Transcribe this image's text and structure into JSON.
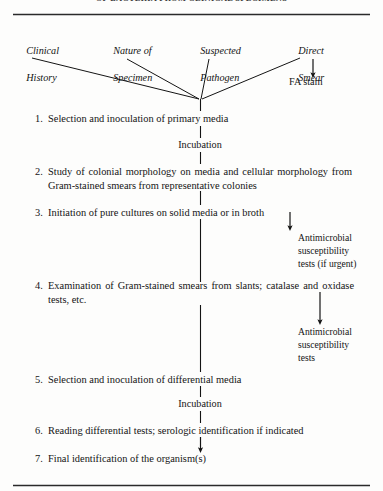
{
  "page": {
    "running_head": "OF BACTERIA FROM CLINICAL SPECIMENS",
    "width": 383,
    "height": 491,
    "background": "#fdfdfc",
    "ink": "#141414"
  },
  "rules": {
    "top_label": "horizontal-rule-top",
    "bottom_label": "horizontal-rule-bottom"
  },
  "sources": [
    {
      "id": "clinical-history",
      "line1": "Clinical",
      "line2": "History"
    },
    {
      "id": "nature-of-specimen",
      "line1": "Nature of",
      "line2": "Specimen"
    },
    {
      "id": "suspected-pathogen",
      "line1": "Suspected",
      "line2": "Pathogen"
    },
    {
      "id": "direct-smear",
      "line1": "Direct",
      "line2": "Smear"
    }
  ],
  "fa_stain": "FA stain",
  "steps": [
    {
      "number": "1.",
      "text": "Selection and inoculation of primary media"
    },
    {
      "number": "2.",
      "text": "Study of colonial morphology on media and cellular morphology from Gram-stained smears from representative colonies"
    },
    {
      "number": "3.",
      "text": "Initiation of pure cultures on solid media or in broth"
    },
    {
      "number": "4.",
      "text": "Examination of Gram-stained smears from slants; catalase and oxidase tests, etc."
    },
    {
      "number": "5.",
      "text": "Selection and inoculation of differential media"
    },
    {
      "number": "6.",
      "text": "Reading differential tests; serologic identification if indicated"
    },
    {
      "number": "7.",
      "text": "Final identification of the organism(s)"
    }
  ],
  "incubation_labels": [
    {
      "id": "incubation-1",
      "text": "Incubation"
    },
    {
      "id": "incubation-2",
      "text": "Incubation"
    }
  ],
  "branches": [
    {
      "id": "antimicrobial-susceptibility-if-urgent",
      "text": "Antimicrobial\nsusceptibility\ntests (if urgent)"
    },
    {
      "id": "antimicrobial-susceptibility",
      "text": "Antimicrobial\nsusceptibility\ntests"
    }
  ]
}
